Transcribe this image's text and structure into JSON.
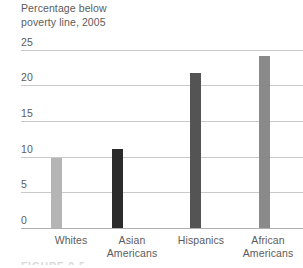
{
  "chart_data": {
    "type": "bar",
    "title": "Percentage below\npoverty line, 2005",
    "xlabel": "",
    "ylabel": "",
    "ylim": [
      0,
      25
    ],
    "yticks": [
      "25",
      "20",
      "15",
      "10",
      "5",
      "0"
    ],
    "ytick_values": [
      25,
      20,
      15,
      10,
      5,
      0
    ],
    "grid": true,
    "legend": "none",
    "categories": [
      "Whites",
      "Asian\nAmericans",
      "Hispanics",
      "African\nAmericans"
    ],
    "values": [
      9.8,
      11.1,
      21.8,
      24.2
    ],
    "bar_colors": [
      "#b5b5b5",
      "#2b2b2b",
      "#545454",
      "#8a8a8a"
    ],
    "series": [
      {
        "name": "Percentage below poverty line, 2005",
        "values": [
          9.8,
          11.1,
          21.8,
          24.2
        ]
      }
    ]
  },
  "figure": {
    "caption_sliver": "FIGURE 9.5"
  },
  "colors": {
    "gridline": "#c9c9c9",
    "axis": "#b0b0b0",
    "text": "#5c5c5e",
    "background": "#ffffff"
  }
}
